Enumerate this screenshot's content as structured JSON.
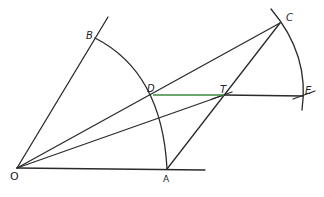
{
  "diagram": {
    "type": "geometric-construction",
    "colors": {
      "stroke": "#2a2a2a",
      "highlight": "#3d8a3d",
      "background": "#ffffff"
    },
    "points": {
      "O": {
        "label": "O",
        "x": 17,
        "y": 168
      },
      "A": {
        "label": "A",
        "x": 167,
        "y": 169
      },
      "B": {
        "label": "B",
        "x": 95,
        "y": 38
      },
      "C": {
        "label": "C",
        "x": 280,
        "y": 23
      },
      "D": {
        "label": "D",
        "x": 153,
        "y": 95
      },
      "T": {
        "label": "T",
        "x": 224,
        "y": 95
      },
      "E": {
        "label": "E",
        "x": 302,
        "y": 96
      }
    },
    "segments": [
      {
        "name": "OA-ray",
        "from": "O",
        "to": "A",
        "extends": true
      },
      {
        "name": "OB-ray",
        "from": "O",
        "to": "B",
        "extends": true
      },
      {
        "name": "OC",
        "from": "O",
        "to": "C"
      },
      {
        "name": "OT",
        "from": "O",
        "to": "T"
      },
      {
        "name": "AC",
        "from": "A",
        "to": "C"
      },
      {
        "name": "DE",
        "from": "D",
        "to": "E"
      }
    ],
    "arcs": [
      {
        "name": "arc-BA",
        "center": "O",
        "from": "B",
        "to": "A"
      },
      {
        "name": "arc-CE",
        "center": "O",
        "through": [
          "C",
          "E"
        ]
      }
    ]
  }
}
